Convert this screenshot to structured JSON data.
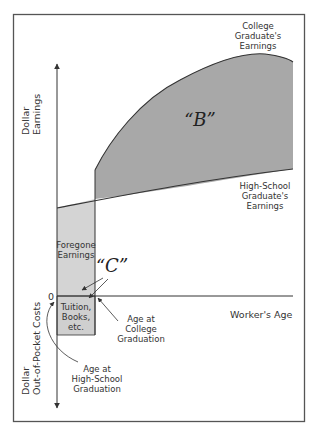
{
  "diagram": {
    "title": "",
    "colors": {
      "college_area": "#a8a8a8",
      "foregone_area": "#d4d4d4",
      "tuition_area": "#cfcfcf",
      "line": "#333333",
      "border": "#555555"
    },
    "y_axis_top_label_line1": "Dollar",
    "y_axis_top_label_line2": "Earnings",
    "y_axis_bottom_label_line1": "Dollar",
    "y_axis_bottom_label_line2": "Out-of-Pocket Costs",
    "x_axis_label": "Worker's Age",
    "origin_label": "0",
    "college_curve_label": [
      "College",
      "Graduate's",
      "Earnings"
    ],
    "hs_curve_label": [
      "High-School",
      "Graduate's",
      "Earnings"
    ],
    "area_b_label": "“B”",
    "area_c_label": "“C”",
    "foregone_label": [
      "Foregone",
      "Earnings"
    ],
    "tuition_label": [
      "Tuition,",
      "Books,",
      "etc."
    ],
    "college_grad_age_label": [
      "Age at",
      "College",
      "Graduation"
    ],
    "hs_grad_age_label": [
      "Age at",
      "High-School",
      "Graduation"
    ]
  }
}
